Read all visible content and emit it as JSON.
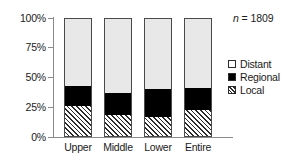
{
  "chart_data": {
    "type": "bar",
    "subtype": "stacked-percent",
    "title": "",
    "xlabel": "",
    "ylabel": "",
    "categories": [
      "Upper",
      "Middle",
      "Lower",
      "Entire"
    ],
    "series": [
      {
        "name": "Distant",
        "values": [
          57,
          63,
          60,
          59
        ],
        "color": "#e8e8e8",
        "pattern": "solid-light"
      },
      {
        "name": "Regional",
        "values": [
          17,
          19,
          24,
          19
        ],
        "color": "#000000",
        "pattern": "solid-black"
      },
      {
        "name": "Local",
        "values": [
          26,
          18,
          16,
          22
        ],
        "color": "#ffffff",
        "pattern": "diagonal-hatch"
      }
    ],
    "ylim": [
      0,
      100
    ],
    "yticks": [
      0,
      25,
      50,
      75,
      100
    ],
    "ytick_labels": [
      "0%",
      "25%",
      "50%",
      "75%",
      "100%"
    ],
    "grid": false,
    "legend_position": "right",
    "stack_order_bottom_to_top": [
      "Local",
      "Regional",
      "Distant"
    ],
    "annotations": [
      {
        "name": "sample-size",
        "text_italic": "n",
        "text_rest": " = 1809",
        "text": "n = 1809"
      }
    ]
  },
  "axis": {
    "y_labels": [
      "100%",
      "75%",
      "50%",
      "25%",
      "0%"
    ],
    "x_labels": [
      "Upper",
      "Middle",
      "Lower",
      "Entire"
    ]
  },
  "legend": {
    "items": [
      {
        "label": "Distant"
      },
      {
        "label": "Regional"
      },
      {
        "label": "Local"
      }
    ]
  },
  "annotation": {
    "n_symbol": "n",
    "n_value": " = 1809"
  }
}
